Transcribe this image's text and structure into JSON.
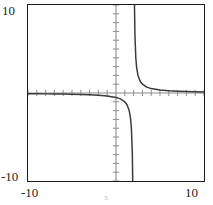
{
  "chart_data": {
    "type": "line",
    "title": "",
    "xlabel": "x",
    "ylabel": "",
    "xlim": [
      -10,
      10
    ],
    "ylim": [
      -10,
      10
    ],
    "grid": false,
    "legend": null,
    "axes": {
      "x_tick_labels": [
        "-10",
        "10"
      ],
      "y_tick_labels": [
        "-10",
        "10"
      ],
      "x_tick_positions": [
        -10,
        10
      ],
      "y_tick_positions": [
        -10,
        10
      ],
      "minor_tick_interval": 1,
      "axis_lines_at": [
        0,
        0
      ],
      "frame": true
    },
    "series": [
      {
        "name": "y = 1/(x - 2)",
        "color": "#3a3a3a",
        "vertical_asymptote": 2,
        "horizontal_asymptote": 0,
        "branches": [
          {
            "name": "left-branch",
            "description": "x < 2, y negative, approaches 0 from below as x decreases, plunges to -infinity near x = 2",
            "x": [
              -10.0,
              -9.0,
              -8.0,
              -7.0,
              -6.0,
              -5.0,
              -4.0,
              -3.0,
              -2.0,
              -1.0,
              0.0,
              0.5,
              1.0,
              1.25,
              1.5,
              1.65,
              1.75,
              1.85,
              1.9,
              1.93,
              1.95
            ],
            "y": [
              -0.083,
              -0.091,
              -0.1,
              -0.111,
              -0.125,
              -0.143,
              -0.167,
              -0.2,
              -0.25,
              -0.333,
              -0.5,
              -0.667,
              -1.0,
              -1.333,
              -2.0,
              -2.857,
              -4.0,
              -6.667,
              -10.0,
              -14.286,
              -20.0
            ]
          },
          {
            "name": "right-branch",
            "description": "x > 2, y positive, descends from +infinity near x = 2 toward 0 as x increases",
            "x": [
              2.05,
              2.07,
              2.1,
              2.15,
              2.25,
              2.35,
              2.5,
              2.75,
              3.0,
              3.5,
              4.0,
              5.0,
              6.0,
              7.0,
              8.0,
              9.0,
              10.0
            ],
            "y": [
              20.0,
              14.286,
              10.0,
              6.667,
              4.0,
              2.857,
              2.0,
              1.333,
              1.0,
              0.667,
              0.5,
              0.333,
              0.25,
              0.2,
              0.167,
              0.143,
              0.125
            ]
          }
        ]
      }
    ]
  },
  "labels": {
    "y_top": "10",
    "y_bottom": "-10",
    "x_left": "-10",
    "x_right": "10",
    "x_axis_title": "x"
  },
  "colors": {
    "curve": "#3a3a3a",
    "axis": "#8c8c8c",
    "frame": "#1b1b1b",
    "text": "#1d1d1d",
    "background": "#ffffff"
  }
}
